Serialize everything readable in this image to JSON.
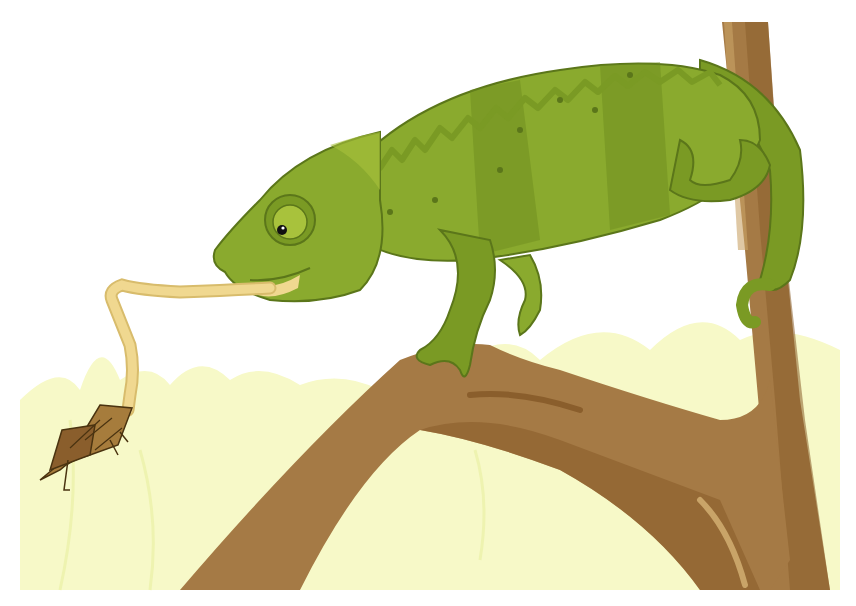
{
  "scene": {
    "title": "Chameleon catching a grasshopper with its tongue",
    "subjects": [
      "chameleon",
      "grasshopper",
      "tree-branch",
      "grass-background"
    ]
  },
  "palette": {
    "background": "#ffffff",
    "grass": "#f7f9c8",
    "grass_dark": "#eef3b0",
    "body_light": "#8aaa2e",
    "body_mid": "#7a9a24",
    "body_dark": "#6b8a1c",
    "outline": "#5b761a",
    "tongue": "#f0d890",
    "tongue_outline": "#d8bc6c",
    "branch": "#a57a45",
    "branch_dark": "#8a5e2c",
    "branch_light": "#c9a468",
    "grasshopper": "#a67c3c",
    "grasshopper_outline": "#4a3310",
    "eye_white": "#a8c23c",
    "pupil": "#111111"
  }
}
